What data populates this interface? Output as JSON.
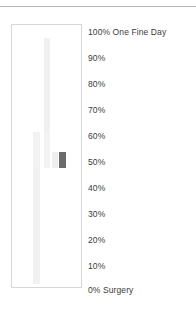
{
  "page": {
    "background_color": "#ffffff",
    "width": 196,
    "height": 309
  },
  "top_rule": {
    "color": "#b9b9b9"
  },
  "plot": {
    "border_color": "#d6d6d6",
    "background_color": "#ffffff"
  },
  "chart_data": {
    "type": "bar",
    "title": "",
    "subtitle": "",
    "xlabel": "",
    "ylabel": "",
    "ylim": [
      0,
      100
    ],
    "grid": false,
    "legend": "right",
    "axis_tick_labels": [
      "100%",
      "90%",
      "80%",
      "70%",
      "60%",
      "50%",
      "40%",
      "30%",
      "20%",
      "10%",
      "0%"
    ],
    "axis_tick_values": [
      100,
      90,
      80,
      70,
      60,
      50,
      40,
      30,
      20,
      10,
      0
    ],
    "top_annotation": "One Fine Day",
    "bottom_annotation": "Surgery",
    "categories": [
      "1",
      "2",
      "3",
      "4"
    ],
    "values": [
      58,
      58,
      45,
      45
    ],
    "bar_colors": [
      "#f0f0f0",
      "#efefef",
      "#ededed",
      "#6b6b6b"
    ],
    "series": [
      {
        "name": "Surgery",
        "values": [
          58,
          58,
          45,
          45
        ]
      }
    ],
    "bars": [
      {
        "id": "bar-1",
        "category": "1",
        "value": 58,
        "color": "#f1f1f1",
        "left_pct": 31.0,
        "width_pct": 10.0,
        "height_pct": 58.0,
        "bottom_pct": 1.0
      },
      {
        "id": "bar-2",
        "category": "2",
        "value": 58,
        "color": "#f0f0f0",
        "left_pct": 46.5,
        "width_pct": 9.0,
        "height_pct": 49.5,
        "bottom_pct": 45.5
      },
      {
        "id": "bar-3",
        "category": "3",
        "value": 45,
        "color": "#ededed",
        "left_pct": 58.5,
        "width_pct": 8.5,
        "height_pct": 6.0,
        "bottom_pct": 45.5
      },
      {
        "id": "bar-4",
        "category": "4",
        "value": 45,
        "color": "#6b6b6b",
        "left_pct": 68.5,
        "width_pct": 9.5,
        "height_pct": 6.0,
        "bottom_pct": 45.5
      },
      {
        "id": "bar-5",
        "category": "1",
        "value": 58,
        "color": "#f2f2f2",
        "left_pct": 31.0,
        "width_pct": 10.0,
        "height_pct": 13.5,
        "bottom_pct": 45.5
      },
      {
        "id": "bar-6",
        "category": "2",
        "value": 58,
        "color": "#f2f2f2",
        "left_pct": 46.5,
        "width_pct": 9.0,
        "height_pct": 13.5,
        "bottom_pct": 45.5
      }
    ]
  },
  "legend": {
    "items": [
      {
        "id": "legend-100",
        "label": "100% One Fine Day",
        "top_px": 1
      },
      {
        "id": "legend-90",
        "label": "90%",
        "top_px": 27
      },
      {
        "id": "legend-80",
        "label": "80%",
        "top_px": 53
      },
      {
        "id": "legend-70",
        "label": "70%",
        "top_px": 79
      },
      {
        "id": "legend-60",
        "label": "60%",
        "top_px": 105
      },
      {
        "id": "legend-50",
        "label": "50%",
        "top_px": 131
      },
      {
        "id": "legend-40",
        "label": "40%",
        "top_px": 157
      },
      {
        "id": "legend-30",
        "label": "30%",
        "top_px": 183
      },
      {
        "id": "legend-20",
        "label": "20%",
        "top_px": 209
      },
      {
        "id": "legend-10",
        "label": "10%",
        "top_px": 235
      },
      {
        "id": "legend-0",
        "label": "0% Surgery",
        "top_px": 259
      }
    ]
  }
}
